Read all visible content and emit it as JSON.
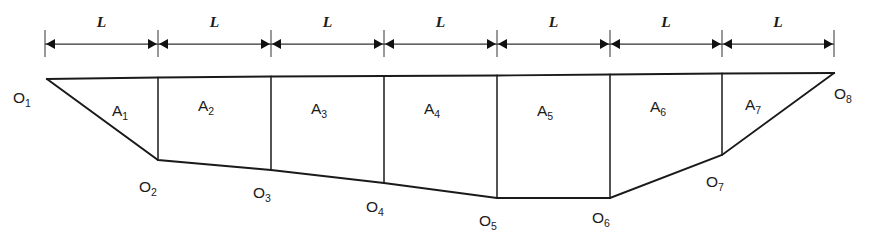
{
  "figure": {
    "type": "engineering-diagram",
    "background_color": "#ffffff",
    "line_color": "#1a1a1a",
    "width": 890,
    "height": 249
  },
  "dimension_row": {
    "tick_positions": [
      45,
      158,
      271,
      384,
      497,
      610,
      722,
      834
    ],
    "tick_top": 30,
    "tick_bottom": 57,
    "dim_y": 44,
    "label_y": 27,
    "segments": [
      {
        "label": "L",
        "from": 45,
        "to": 158
      },
      {
        "label": "L",
        "from": 158,
        "to": 271
      },
      {
        "label": "L",
        "from": 271,
        "to": 384
      },
      {
        "label": "L",
        "from": 384,
        "to": 497
      },
      {
        "label": "L",
        "from": 497,
        "to": 610
      },
      {
        "label": "L",
        "from": 610,
        "to": 722
      },
      {
        "label": "L",
        "from": 722,
        "to": 834
      }
    ]
  },
  "top_chord": {
    "points": [
      [
        47,
        79
      ],
      [
        158,
        77.5
      ],
      [
        271,
        76.5
      ],
      [
        384,
        76
      ],
      [
        497,
        75.5
      ],
      [
        610,
        74.5
      ],
      [
        722,
        73.5
      ],
      [
        834,
        73
      ]
    ]
  },
  "bottom_chord": {
    "points": [
      [
        47,
        79
      ],
      [
        158,
        160
      ],
      [
        271,
        170
      ],
      [
        384,
        183
      ],
      [
        497,
        198
      ],
      [
        610,
        198
      ],
      [
        722,
        155
      ],
      [
        834,
        73
      ]
    ]
  },
  "verticals": [
    {
      "x": 158,
      "y1": 77.5,
      "y2": 160
    },
    {
      "x": 271,
      "y1": 76.5,
      "y2": 170
    },
    {
      "x": 384,
      "y1": 76,
      "y2": 183
    },
    {
      "x": 497,
      "y1": 75.5,
      "y2": 198
    },
    {
      "x": 610,
      "y1": 74.5,
      "y2": 198
    },
    {
      "x": 722,
      "y1": 73.5,
      "y2": 155
    }
  ],
  "panel_labels": [
    {
      "base": "A",
      "sub": "1",
      "x": 120,
      "y": 116
    },
    {
      "base": "A",
      "sub": "2",
      "x": 206,
      "y": 111
    },
    {
      "base": "A",
      "sub": "3",
      "x": 319,
      "y": 114
    },
    {
      "base": "A",
      "sub": "4",
      "x": 432,
      "y": 114
    },
    {
      "base": "A",
      "sub": "5",
      "x": 545,
      "y": 116
    },
    {
      "base": "A",
      "sub": "6",
      "x": 658,
      "y": 112
    },
    {
      "base": "A",
      "sub": "7",
      "x": 753,
      "y": 110
    }
  ],
  "node_labels": [
    {
      "base": "O",
      "sub": "1",
      "x": 22,
      "y": 103
    },
    {
      "base": "O",
      "sub": "2",
      "x": 148,
      "y": 192
    },
    {
      "base": "O",
      "sub": "3",
      "x": 262,
      "y": 198
    },
    {
      "base": "O",
      "sub": "4",
      "x": 375,
      "y": 212
    },
    {
      "base": "O",
      "sub": "5",
      "x": 488,
      "y": 226
    },
    {
      "base": "O",
      "sub": "6",
      "x": 601,
      "y": 223
    },
    {
      "base": "O",
      "sub": "7",
      "x": 715,
      "y": 187
    },
    {
      "base": "O",
      "sub": "8",
      "x": 843,
      "y": 99
    }
  ]
}
